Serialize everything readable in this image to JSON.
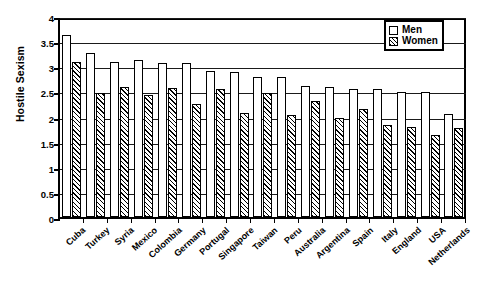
{
  "chart_data": {
    "type": "bar",
    "title": "",
    "subtitle": "",
    "xlabel": "",
    "ylabel": "Hostile Sexism",
    "ylim": [
      0,
      4
    ],
    "ytick_step": 0.5,
    "yticks": [
      "0",
      "0.5",
      "1",
      "1.5",
      "2",
      "2.5",
      "3",
      "3.5",
      "4"
    ],
    "grid": true,
    "grid_axis": "y",
    "legend_position": "top-right",
    "categories": [
      "Cuba",
      "Turkey",
      "Syria",
      "Mexico",
      "Colombia",
      "Germany",
      "Portugal",
      "Singapore",
      "Taiwan",
      "Peru",
      "Australia",
      "Argentina",
      "Spain",
      "Italy",
      "England",
      "USA",
      "Netherlands"
    ],
    "series": [
      {
        "name": "Men",
        "fill": "open",
        "values": [
          3.62,
          3.27,
          3.08,
          3.12,
          3.07,
          3.07,
          2.9,
          2.89,
          2.78,
          2.79,
          2.6,
          2.59,
          2.55,
          2.55,
          2.49,
          2.48,
          2.05
        ]
      },
      {
        "name": "Women",
        "fill": "hatched",
        "values": [
          3.08,
          2.47,
          2.58,
          2.42,
          2.57,
          2.25,
          2.55,
          2.07,
          2.46,
          2.04,
          2.3,
          1.97,
          2.14,
          1.83,
          1.8,
          1.63,
          1.78
        ]
      }
    ]
  },
  "legend": {
    "items": [
      {
        "label": "Men",
        "swatch": "open-square"
      },
      {
        "label": "Women",
        "swatch": "hatched-square"
      }
    ]
  },
  "axes": {
    "y_title": "Hostile Sexism"
  },
  "colors": {
    "axis": "#000000",
    "grid": "#1a1a1a",
    "bar_men": "#ffffff",
    "bar_women_hatch": "#000000",
    "background": "#ffffff"
  }
}
